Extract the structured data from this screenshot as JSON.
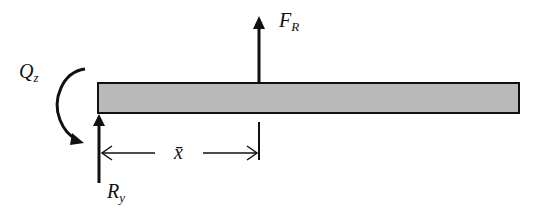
{
  "diagram": {
    "type": "free-body-diagram",
    "colors": {
      "beam_fill": "#b9b9b9",
      "stroke": "#111111",
      "background": "#ffffff"
    },
    "labels": {
      "resultant_force": {
        "main": "F",
        "sub": "R"
      },
      "reaction_force": {
        "main": "R",
        "sub": "y"
      },
      "reaction_moment": {
        "main": "Q",
        "sub": "z"
      },
      "distance": "x̄"
    }
  }
}
